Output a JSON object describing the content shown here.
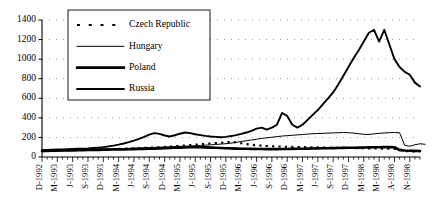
{
  "chart_data": {
    "type": "line",
    "title": "",
    "subtitle": "",
    "xlabel": "",
    "ylabel": "",
    "ylim": [
      0,
      1400
    ],
    "ytick_step": 200,
    "yticks": [
      0,
      200,
      400,
      600,
      800,
      1000,
      1200,
      1400
    ],
    "grid": true,
    "grid_style": "dotted-horizontal",
    "legend_position": "top-left-inside",
    "x_tick_labels": [
      "D-1992",
      "M-1993",
      "J-1993",
      "S-1993",
      "D-1993",
      "M-1994",
      "J-1994",
      "S-1994",
      "D-1994",
      "M-1995",
      "J-1995",
      "S-1995",
      "D-1995",
      "M-1996",
      "J-1996",
      "S-1996",
      "D-1996",
      "M-1997",
      "J-1997",
      "S-1997",
      "D-1997",
      "M-1998",
      "M-1998",
      "A-1998",
      "N-1998",
      "F-1999"
    ],
    "x_label_interval": 3,
    "x_points_count": 75,
    "series": [
      {
        "name": "Czech Republic",
        "style": "dotted",
        "color": "#000000",
        "width": 2.1,
        "values": [
          60,
          62,
          63,
          65,
          66,
          68,
          70,
          71,
          72,
          74,
          75,
          77,
          78,
          80,
          82,
          84,
          86,
          88,
          90,
          92,
          94,
          96,
          98,
          100,
          103,
          106,
          110,
          114,
          118,
          122,
          126,
          130,
          134,
          138,
          142,
          146,
          150,
          155,
          150,
          140,
          132,
          126,
          120,
          116,
          112,
          110,
          108,
          106,
          104,
          103,
          102,
          101,
          100,
          99,
          98,
          97,
          96,
          95,
          94,
          93,
          92,
          91,
          90,
          89,
          88,
          87,
          86,
          85,
          84,
          83,
          82,
          60,
          58,
          57,
          56
        ]
      },
      {
        "name": "Hungary",
        "style": "thin-solid",
        "color": "#000000",
        "width": 1.0,
        "values": [
          70,
          71,
          72,
          73,
          74,
          75,
          76,
          77,
          78,
          79,
          80,
          81,
          82,
          83,
          84,
          85,
          86,
          88,
          90,
          92,
          94,
          96,
          98,
          100,
          102,
          104,
          106,
          108,
          110,
          112,
          115,
          118,
          121,
          124,
          128,
          132,
          136,
          142,
          150,
          158,
          166,
          174,
          182,
          190,
          196,
          202,
          208,
          214,
          218,
          222,
          226,
          230,
          234,
          238,
          240,
          242,
          244,
          246,
          248,
          250,
          248,
          244,
          238,
          232,
          230,
          236,
          242,
          246,
          248,
          250,
          248,
          120,
          110,
          125,
          135,
          130
        ]
      },
      {
        "name": "Poland",
        "style": "thick-solid",
        "color": "#000000",
        "width": 2.6,
        "values": [
          62,
          63,
          64,
          65,
          66,
          67,
          68,
          69,
          70,
          71,
          72,
          73,
          74,
          75,
          76,
          77,
          78,
          79,
          80,
          81,
          82,
          84,
          86,
          88,
          90,
          92,
          94,
          96,
          98,
          100,
          102,
          100,
          98,
          96,
          94,
          92,
          90,
          88,
          86,
          85,
          84,
          83,
          82,
          81,
          80,
          80,
          80,
          81,
          82,
          83,
          84,
          85,
          86,
          87,
          88,
          89,
          90,
          91,
          92,
          93,
          94,
          95,
          96,
          97,
          98,
          99,
          100,
          101,
          102,
          100,
          70,
          66,
          64,
          63,
          62
        ]
      },
      {
        "name": "Russia",
        "style": "medium-solid",
        "color": "#000000",
        "width": 1.9,
        "values": [
          70,
          72,
          74,
          76,
          78,
          80,
          82,
          84,
          86,
          88,
          92,
          96,
          100,
          108,
          116,
          126,
          138,
          152,
          168,
          186,
          206,
          228,
          244,
          236,
          220,
          210,
          222,
          238,
          250,
          244,
          232,
          224,
          216,
          210,
          206,
          202,
          206,
          214,
          224,
          236,
          250,
          268,
          290,
          300,
          280,
          300,
          330,
          450,
          420,
          330,
          300,
          330,
          380,
          430,
          480,
          540,
          600,
          660,
          740,
          830,
          920,
          1010,
          1090,
          1180,
          1270,
          1300,
          1180,
          1300,
          1150,
          1000,
          920,
          870,
          840,
          760,
          720
        ],
        "peak_value": 1300,
        "peak_label": "J-1997",
        "crash_note": "collapses toward ~0 at A-1998 / N-1998"
      }
    ],
    "legend_entries": [
      {
        "label": "Czech Republic",
        "style": "dotted"
      },
      {
        "label": "Hungary",
        "style": "thin-solid"
      },
      {
        "label": "Poland",
        "style": "thick-solid"
      },
      {
        "label": "Russia",
        "style": "medium-solid"
      }
    ]
  }
}
